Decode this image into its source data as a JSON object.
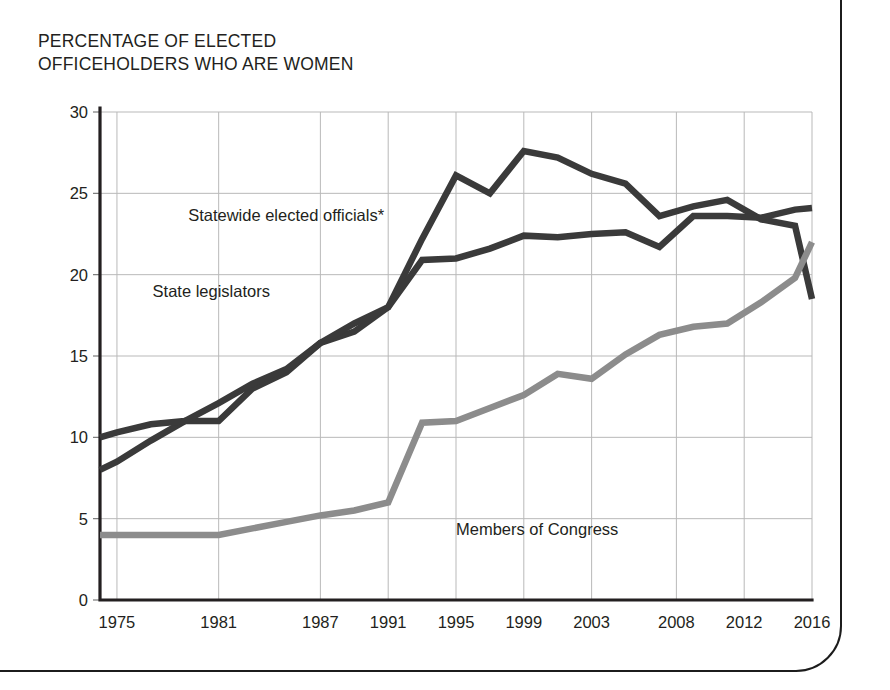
{
  "chart_data": {
    "type": "line",
    "title": "PERCENTAGE OF ELECTED\nOFFICEHOLDERS WHO ARE WOMEN",
    "xlabel": "",
    "ylabel": "",
    "ylim": [
      0,
      30
    ],
    "xlim": [
      1974,
      2016
    ],
    "grid": true,
    "legend_position": "inline-annotations",
    "ytick_labels": [
      "0",
      "5",
      "10",
      "15",
      "20",
      "25",
      "30"
    ],
    "ytick_values": [
      0,
      5,
      10,
      15,
      20,
      25,
      30
    ],
    "xtick_labels": [
      "1975",
      "1981",
      "1987",
      "1991",
      "1995",
      "1999",
      "2003",
      "2008",
      "2012",
      "2016"
    ],
    "xtick_values": [
      1975,
      1981,
      1987,
      1991,
      1995,
      1999,
      2003,
      2008,
      2012,
      2016
    ],
    "series": [
      {
        "name": "Statewide elected officials*",
        "color": "#3a3a3a",
        "label_x": 1979.2,
        "label_y": 23.3,
        "x": [
          1974,
          1975,
          1977,
          1979,
          1981,
          1983,
          1985,
          1987,
          1989,
          1991,
          1993,
          1995,
          1997,
          1999,
          2001,
          2003,
          2005,
          2007,
          2009,
          2011,
          2013,
          2015,
          2016
        ],
        "values": [
          8.0,
          8.5,
          9.8,
          11.0,
          11.0,
          13.0,
          14.0,
          15.8,
          16.5,
          18.0,
          22.2,
          26.1,
          25.0,
          27.6,
          27.2,
          26.2,
          25.6,
          23.6,
          24.2,
          24.6,
          23.4,
          23.0,
          18.5
        ]
      },
      {
        "name": "State legislators",
        "color": "#3a3a3a",
        "label_x": 1977.1,
        "label_y": 18.6,
        "x": [
          1974,
          1975,
          1977,
          1979,
          1981,
          1983,
          1985,
          1987,
          1989,
          1991,
          1993,
          1995,
          1997,
          1999,
          2001,
          2003,
          2005,
          2007,
          2009,
          2011,
          2013,
          2015,
          2016
        ],
        "values": [
          10.0,
          10.3,
          10.8,
          11.0,
          12.1,
          13.3,
          14.2,
          15.8,
          17.0,
          18.0,
          20.9,
          21.0,
          21.6,
          22.4,
          22.3,
          22.5,
          22.6,
          21.7,
          23.6,
          23.6,
          23.5,
          24.0,
          24.1
        ]
      },
      {
        "name": "Members of Congress",
        "color": "#8c8c8c",
        "label_x": 1995.0,
        "label_y": 4.0,
        "x": [
          1974,
          1975,
          1977,
          1979,
          1981,
          1983,
          1985,
          1987,
          1989,
          1991,
          1993,
          1995,
          1997,
          1999,
          2001,
          2003,
          2005,
          2007,
          2009,
          2011,
          2013,
          2015,
          2016
        ],
        "values": [
          4.0,
          4.0,
          4.0,
          4.0,
          4.0,
          4.4,
          4.8,
          5.2,
          5.5,
          6.0,
          10.9,
          11.0,
          11.8,
          12.6,
          13.9,
          13.6,
          15.1,
          16.3,
          16.8,
          17.0,
          18.3,
          19.8,
          22.0
        ]
      }
    ]
  },
  "page": {
    "background_color": "#ffffff",
    "frame_color": "#1c1c1c",
    "axis_color": "#231f20",
    "grid_color": "#b9b9b9"
  }
}
